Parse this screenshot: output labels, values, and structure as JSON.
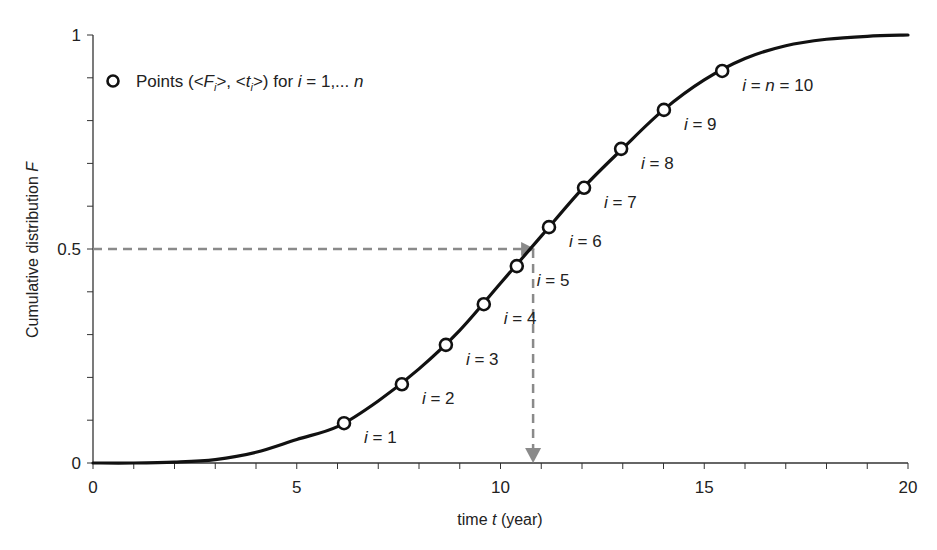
{
  "chart_data": {
    "type": "line",
    "title": "",
    "xlabel": "time t (year)",
    "xlabel_parts": {
      "pre": "time ",
      "var": "t",
      "post": " (year)"
    },
    "ylabel": "Cumulative distribution F",
    "ylabel_parts": {
      "pre": "Cumulative distribution ",
      "var": "F"
    },
    "xlim": [
      0,
      20
    ],
    "ylim": [
      0,
      1
    ],
    "x_ticks": [
      0,
      5,
      10,
      15,
      20
    ],
    "x_tick_labels": [
      "0",
      "5",
      "10",
      "15",
      "20"
    ],
    "y_ticks": [
      0,
      0.5,
      1
    ],
    "y_tick_labels": [
      "0",
      "0.5",
      "1"
    ],
    "x_minor_step": 1,
    "y_minor_step": 0.1,
    "grid": false,
    "legend": {
      "position": "upper-left",
      "entries": [
        {
          "marker": "open-circle",
          "label": "Points (<Fi>, <ti>) for i = 1,... n"
        }
      ]
    },
    "series": [
      {
        "name": "Cumulative distribution curve",
        "style": "solid-black-line",
        "x": [
          0,
          1,
          2,
          3,
          4,
          5,
          6,
          7,
          8,
          9,
          10,
          11,
          12,
          13,
          14,
          15,
          16,
          17,
          18,
          19,
          20
        ],
        "y": [
          0.0,
          0.0,
          0.002,
          0.008,
          0.025,
          0.055,
          0.085,
          0.145,
          0.22,
          0.31,
          0.42,
          0.53,
          0.64,
          0.735,
          0.825,
          0.895,
          0.945,
          0.975,
          0.99,
          0.997,
          1.0
        ]
      },
      {
        "name": "Points (<Fi>, <ti>)",
        "style": "open-circle-markers",
        "i": [
          1,
          2,
          3,
          4,
          5,
          6,
          7,
          8,
          9,
          10
        ],
        "x": [
          6.16,
          7.58,
          8.66,
          9.59,
          10.4,
          11.19,
          12.05,
          12.96,
          14.01,
          15.44
        ],
        "y": [
          0.093,
          0.184,
          0.276,
          0.371,
          0.46,
          0.551,
          0.643,
          0.734,
          0.825,
          0.916
        ],
        "labels": [
          "i = 1",
          "i = 2",
          "i = 3",
          "i = 4",
          "i = 5",
          "i = 6",
          "i = 7",
          "i = 8",
          "i = 9",
          "i = n = 10"
        ]
      }
    ],
    "annotations": [
      {
        "type": "dashed-arrow",
        "from": [
          0,
          0.5
        ],
        "to": [
          10.8,
          0.5
        ],
        "color": "#8a8a8a"
      },
      {
        "type": "dashed-arrow",
        "from": [
          10.8,
          0.5
        ],
        "to": [
          10.8,
          0
        ],
        "color": "#8a8a8a"
      }
    ]
  },
  "colors": {
    "curve": "#111111",
    "axis": "#333333",
    "dashed": "#8a8a8a",
    "text": "#222222",
    "marker_fill": "#ffffff"
  },
  "legend_text": {
    "pre": "Points (<",
    "F": "F",
    "sub1": "i",
    "mid": ">, <",
    "t": "t",
    "sub2": "i",
    "post": ">) for ",
    "i": "i",
    "eq": " = 1,... ",
    "n": "n"
  }
}
